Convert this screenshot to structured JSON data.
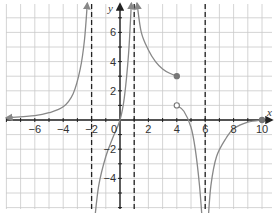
{
  "chart_data": {
    "type": "line",
    "title": "",
    "xlabel": "x",
    "ylabel": "y",
    "xlim": [
      -8,
      11
    ],
    "ylim": [
      -7,
      8
    ],
    "grid": true,
    "x_ticks": [
      -6,
      -4,
      -2,
      2,
      4,
      6,
      8,
      10
    ],
    "x_tick_labels": [
      "−6",
      "−4",
      "−2",
      "2",
      "4",
      "6",
      "8",
      "10"
    ],
    "y_ticks": [
      6,
      4,
      2,
      -2,
      -4
    ],
    "y_tick_labels": [
      "6",
      "4",
      "2",
      "−2",
      "−4"
    ],
    "origin_label": "0",
    "asymptotes": [
      {
        "type": "vertical",
        "x": -2
      },
      {
        "type": "vertical",
        "x": 1
      },
      {
        "type": "vertical",
        "x": 6
      }
    ],
    "series": [
      {
        "name": "branch-left",
        "description": "approaches y=0 as x→-∞, rises to +∞ as x→-2⁻",
        "points": [
          [
            -8,
            0.15
          ],
          [
            -6,
            0.3
          ],
          [
            -5,
            0.5
          ],
          [
            -4,
            0.9
          ],
          [
            -3.3,
            1.8
          ],
          [
            -2.8,
            3.5
          ],
          [
            -2.5,
            5.5
          ],
          [
            -2.3,
            8
          ]
        ],
        "end_arrows": [
          "left",
          "up"
        ]
      },
      {
        "name": "branch-middle",
        "description": "from -∞ at x→-2⁺ through origin to +∞ at x→1⁻",
        "points": [
          [
            -1.8,
            -7
          ],
          [
            -1.5,
            -4.5
          ],
          [
            -1,
            -2.5
          ],
          [
            -0.5,
            -1.2
          ],
          [
            0,
            0
          ],
          [
            0.3,
            1.5
          ],
          [
            0.6,
            4.5
          ],
          [
            0.8,
            8
          ]
        ],
        "end_arrows": [
          "down",
          "up"
        ]
      },
      {
        "name": "branch-right-upper",
        "description": "from +∞ at x→1⁺ decreasing to closed point (4,3)",
        "points": [
          [
            1.2,
            8
          ],
          [
            1.5,
            6
          ],
          [
            2,
            4.8
          ],
          [
            2.5,
            4
          ],
          [
            3,
            3.5
          ],
          [
            3.5,
            3.2
          ],
          [
            4,
            3
          ]
        ],
        "end_arrows": [
          "up"
        ],
        "endpoint": {
          "x": 4,
          "y": 3,
          "closed": true
        }
      },
      {
        "name": "branch-right-lower",
        "description": "from open point (4,1) descending to -∞ as x→6⁻",
        "points": [
          [
            4,
            1
          ],
          [
            4.5,
            0.6
          ],
          [
            5,
            -0.5
          ],
          [
            5.3,
            -2
          ],
          [
            5.6,
            -4.5
          ],
          [
            5.8,
            -7
          ]
        ],
        "end_arrows": [
          "down"
        ],
        "startpoint": {
          "x": 4,
          "y": 1,
          "closed": false
        }
      },
      {
        "name": "branch-far-right",
        "description": "from -∞ as x→6⁺ rising to closed point (10,0)",
        "points": [
          [
            6.2,
            -7
          ],
          [
            6.4,
            -4.5
          ],
          [
            6.8,
            -2.5
          ],
          [
            7.5,
            -1.2
          ],
          [
            8,
            -0.6
          ],
          [
            9,
            -0.15
          ],
          [
            10,
            0
          ]
        ],
        "end_arrows": [
          "down"
        ],
        "endpoint": {
          "x": 10,
          "y": 0,
          "closed": true
        }
      }
    ]
  }
}
